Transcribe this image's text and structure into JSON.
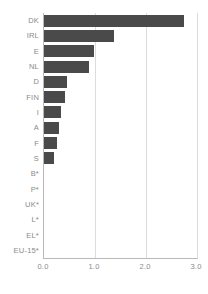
{
  "chart_data": {
    "type": "bar",
    "orientation": "horizontal",
    "title": "",
    "subtitle": "",
    "xlabel": "",
    "ylabel": "",
    "categories": [
      "DK",
      "IRL",
      "E",
      "NL",
      "D",
      "FIN",
      "I",
      "A",
      "F",
      "S",
      "B*",
      "P*",
      "UK*",
      "L*",
      "EL*",
      "EU-15*"
    ],
    "values": [
      2.75,
      1.38,
      0.99,
      0.89,
      0.45,
      0.41,
      0.33,
      0.29,
      0.25,
      0.2,
      0,
      0,
      0,
      0,
      0,
      0
    ],
    "series": [
      {
        "name": "",
        "values": [
          2.75,
          1.38,
          0.99,
          0.89,
          0.45,
          0.41,
          0.33,
          0.29,
          0.25,
          0.2,
          0,
          0,
          0,
          0,
          0,
          0
        ]
      }
    ],
    "xlim": [
      0.0,
      3.0
    ],
    "xticks": [
      0.0,
      1.0,
      2.0,
      3.0
    ],
    "xtick_labels": [
      "0.0",
      "1.0",
      "2.0",
      "3.0"
    ],
    "grid": "vertical",
    "legend": "none",
    "bar_color": "#4a4a4a",
    "grid_color": "#dcdcdc",
    "axis_color": "#b9b9b9",
    "label_color": "#8a8a8a",
    "annotations": []
  }
}
